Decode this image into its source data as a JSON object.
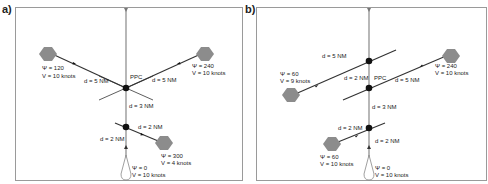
{
  "panels": [
    {
      "label": "a)",
      "ppc_label": "PPC",
      "own_ship": {
        "psi": "Ψ = 0",
        "v": "V = 10 knots"
      },
      "targets": [
        {
          "psi": "Ψ = 120",
          "v": "V = 10 knots",
          "d": "d = 5 NM"
        },
        {
          "psi": "Ψ = 240",
          "v": "V = 10 knots",
          "d": "d = 5 NM"
        },
        {
          "psi": "Ψ = 300",
          "v": "V = 4 knots",
          "d": "d = 2 NM"
        }
      ],
      "distances": {
        "ppc_to_lower": "d = 3 NM",
        "lower_to_own": "d = 2 NM"
      }
    },
    {
      "label": "b)",
      "ppc_label": "PPC",
      "own_ship": {
        "psi": "Ψ = 0",
        "v": "V = 10 knots"
      },
      "targets": [
        {
          "psi": "Ψ = 60",
          "v": "V =  9 knots",
          "d": "d = 5 NM"
        },
        {
          "psi": "Ψ = 240",
          "v": "V = 10 knots",
          "d": "d = 5 NM"
        },
        {
          "psi": "Ψ = 60",
          "v": "V = 10 knots",
          "d": "d = 2 NM"
        }
      ],
      "distances": {
        "upper_to_ppc": "d = 2 NM",
        "ppc_to_lower": "d = 3 NM",
        "lower_to_own": "d = 2 NM"
      }
    }
  ],
  "colors": {
    "frame": "#9a9a9a",
    "track": "#333333",
    "axis": "#888888",
    "ship": "#8c8c8c",
    "node": "#111111"
  }
}
